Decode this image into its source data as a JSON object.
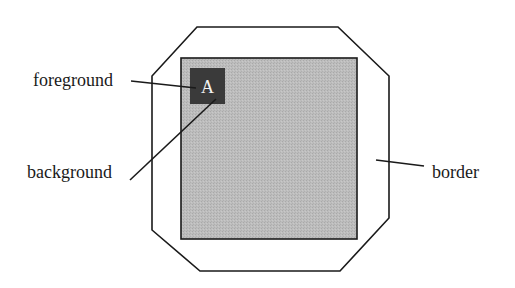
{
  "diagram": {
    "type": "labeled-widget-anatomy",
    "labels": {
      "foreground": "foreground",
      "background": "background",
      "border": "border"
    },
    "glyph": "A",
    "colors": {
      "outline": "#1a1a1a",
      "background_fill": "#b9b9b9",
      "foreground_fill": "#3a3a3a",
      "glyph": "#f2f2f2",
      "page": "#ffffff"
    }
  }
}
